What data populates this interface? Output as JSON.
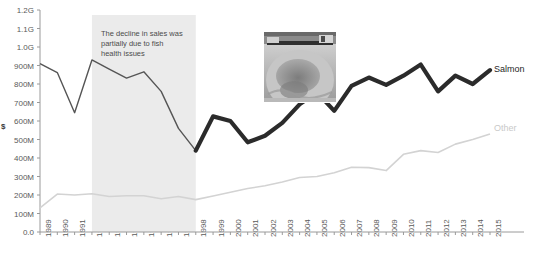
{
  "chart_data": {
    "type": "line",
    "title": "",
    "xlabel": "",
    "ylabel": "$",
    "ylim": [
      0,
      1200000000
    ],
    "ytick_labels": [
      "1.2G",
      "1.1G",
      "1.0G",
      "900M",
      "800M",
      "700M",
      "600M",
      "500M",
      "400M",
      "300M",
      "200M",
      "100M",
      "0.0"
    ],
    "ytick_values": [
      1200000000,
      1100000000,
      1000000000,
      900000000,
      800000000,
      700000000,
      600000000,
      500000000,
      400000000,
      300000000,
      200000000,
      100000000,
      0
    ],
    "grid": false,
    "legend_position": "right-inline",
    "categories": [
      "1989",
      "1990",
      "1991",
      "1992",
      "1993",
      "1994",
      "1995",
      "1996",
      "1997",
      "1998",
      "1999",
      "2000",
      "2001",
      "2002",
      "2003",
      "2004",
      "2005",
      "2006",
      "2007",
      "2008",
      "2009",
      "2010",
      "2011",
      "2012",
      "2013",
      "2014",
      "2015"
    ],
    "series": [
      {
        "name": "Salmon",
        "color": "#2b2b2b",
        "values": [
          910000000,
          862000000,
          645000000,
          930000000,
          880000000,
          832000000,
          866000000,
          760000000,
          560000000,
          440000000,
          625000000,
          600000000,
          485000000,
          520000000,
          590000000,
          690000000,
          755000000,
          655000000,
          790000000,
          835000000,
          795000000,
          845000000,
          905000000,
          760000000,
          845000000,
          800000000,
          875000000
        ]
      },
      {
        "name": "Other",
        "color": "#d3d3d3",
        "values": [
          130000000,
          205000000,
          200000000,
          207000000,
          192000000,
          196000000,
          196000000,
          180000000,
          192000000,
          175000000,
          195000000,
          215000000,
          235000000,
          250000000,
          270000000,
          295000000,
          300000000,
          320000000,
          350000000,
          348000000,
          332000000,
          420000000,
          440000000,
          430000000,
          475000000,
          500000000,
          530000000
        ]
      }
    ],
    "annotations": [
      {
        "name": "decline-note",
        "text": "The decline in sales was\npartially due to fish\nhealth issues",
        "x_start": "1992",
        "x_end": "1998"
      }
    ],
    "shaded_band": {
      "x_start": "1992",
      "x_end": "1998",
      "color": "#ebebeb"
    }
  },
  "labels": {
    "y_axis_title": "$",
    "salmon_series_label": "Salmon",
    "other_series_label": "Other",
    "annotation_text": "The decline in sales was\npartially due to fish\nhealth issues",
    "cropped_title_fragment": ""
  },
  "photo": {
    "name": "fish-pen-photo",
    "alt": "Fish farm net pen"
  }
}
